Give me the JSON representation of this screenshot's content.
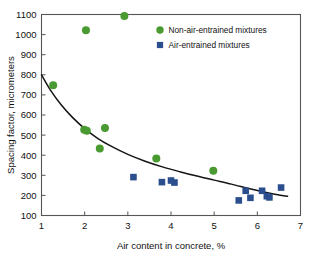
{
  "chart_data": {
    "type": "scatter",
    "title": "",
    "xlabel": "Air content in concrete, %",
    "ylabel": "Spacing factor, micrometers",
    "xlim": [
      1,
      7
    ],
    "ylim": [
      100,
      1100
    ],
    "xticks": [
      1,
      2,
      3,
      4,
      5,
      6,
      7
    ],
    "yticks": [
      100,
      200,
      300,
      400,
      500,
      600,
      700,
      800,
      900,
      1000,
      1100
    ],
    "xtick_labels": [
      "1",
      "2",
      "3",
      "4",
      "5",
      "6",
      "7"
    ],
    "ytick_labels": [
      "100",
      "200",
      "300",
      "400",
      "500",
      "600",
      "700",
      "800",
      "900",
      "1000",
      "1100"
    ],
    "grid": false,
    "legend_position": "top-right",
    "series": [
      {
        "name": "Non-air-entrained mixtures",
        "marker": "circle",
        "color": "#4a9a32",
        "points": [
          {
            "x": 1.27,
            "y": 748
          },
          {
            "x": 2.03,
            "y": 1022
          },
          {
            "x": 2.92,
            "y": 1093
          },
          {
            "x": 1.99,
            "y": 527
          },
          {
            "x": 2.05,
            "y": 522
          },
          {
            "x": 2.47,
            "y": 535
          },
          {
            "x": 2.35,
            "y": 433
          },
          {
            "x": 3.66,
            "y": 384
          },
          {
            "x": 4.98,
            "y": 323
          }
        ]
      },
      {
        "name": "Air-entrained mixtures",
        "marker": "square",
        "color": "#2b4f8e",
        "points": [
          {
            "x": 3.13,
            "y": 291
          },
          {
            "x": 3.79,
            "y": 266
          },
          {
            "x": 4.0,
            "y": 274
          },
          {
            "x": 4.08,
            "y": 264
          },
          {
            "x": 5.57,
            "y": 175
          },
          {
            "x": 5.73,
            "y": 223
          },
          {
            "x": 5.84,
            "y": 188
          },
          {
            "x": 6.11,
            "y": 223
          },
          {
            "x": 6.22,
            "y": 196
          },
          {
            "x": 6.28,
            "y": 190
          },
          {
            "x": 6.55,
            "y": 239
          }
        ]
      }
    ],
    "fit_curve": {
      "name": "trend-line",
      "color": "#151515",
      "points": [
        {
          "x": 1.0,
          "y": 800
        },
        {
          "x": 1.2,
          "y": 726
        },
        {
          "x": 1.45,
          "y": 652
        },
        {
          "x": 1.7,
          "y": 592
        },
        {
          "x": 2.0,
          "y": 532
        },
        {
          "x": 2.3,
          "y": 484
        },
        {
          "x": 2.6,
          "y": 446
        },
        {
          "x": 3.0,
          "y": 404
        },
        {
          "x": 3.4,
          "y": 370
        },
        {
          "x": 3.8,
          "y": 342
        },
        {
          "x": 4.2,
          "y": 318
        },
        {
          "x": 4.6,
          "y": 296
        },
        {
          "x": 5.0,
          "y": 276
        },
        {
          "x": 5.4,
          "y": 256
        },
        {
          "x": 5.8,
          "y": 234
        },
        {
          "x": 6.1,
          "y": 219
        },
        {
          "x": 6.4,
          "y": 206
        },
        {
          "x": 6.7,
          "y": 196
        }
      ]
    },
    "legend": [
      {
        "label": "Non-air-entrained mixtures",
        "marker": "circle",
        "color": "#4a9a32"
      },
      {
        "label": "Air-entrained mixtures",
        "marker": "square",
        "color": "#2b4f8e"
      }
    ]
  }
}
